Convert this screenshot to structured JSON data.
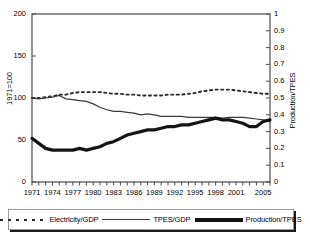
{
  "chart_data": {
    "type": "line",
    "title": "",
    "xlabel": "",
    "ylabel": "1971=100",
    "ylabel_right": "Production/TPES",
    "xlim": [
      1971,
      2006
    ],
    "ylim": [
      0,
      200
    ],
    "ylim_right": [
      0,
      1
    ],
    "grid": false,
    "legend_position": "bottom",
    "x": [
      1971,
      1972,
      1973,
      1974,
      1975,
      1976,
      1977,
      1978,
      1979,
      1980,
      1981,
      1982,
      1983,
      1984,
      1985,
      1986,
      1987,
      1988,
      1989,
      1990,
      1991,
      1992,
      1993,
      1994,
      1995,
      1996,
      1997,
      1998,
      1999,
      2000,
      2001,
      2002,
      2003,
      2004,
      2005,
      2006
    ],
    "yticks_left": [
      "0",
      "50",
      "100",
      "150",
      "200"
    ],
    "yticks_right": [
      "0",
      "0.1",
      "0.2",
      "0.3",
      "0.4",
      "0.5",
      "0.6",
      "0.7",
      "0.8",
      "0.9",
      "1"
    ],
    "xticks": [
      "1971",
      "1974",
      "1977",
      "1980",
      "1983",
      "1986",
      "1989",
      "1992",
      "1995",
      "1998",
      "2001",
      "2005"
    ],
    "series": [
      {
        "name": "Electricity/GDP",
        "axis": "left",
        "style": "dotted",
        "color": "#2b2b2b",
        "values": [
          100,
          100,
          101,
          102,
          104,
          104,
          106,
          107,
          107,
          107,
          107,
          106,
          105,
          105,
          104,
          104,
          103,
          103,
          103,
          103,
          104,
          104,
          104,
          105,
          106,
          108,
          109,
          110,
          110,
          110,
          109,
          108,
          107,
          106,
          105,
          105
        ]
      },
      {
        "name": "TPES/GDP",
        "axis": "left",
        "style": "solid-thin",
        "color": "#3a3a3a",
        "values": [
          100,
          99,
          100,
          101,
          103,
          99,
          98,
          97,
          96,
          93,
          89,
          86,
          84,
          84,
          83,
          82,
          80,
          81,
          80,
          78,
          78,
          78,
          78,
          77,
          77,
          77,
          77,
          77,
          76,
          77,
          77,
          77,
          76,
          75,
          74,
          72
        ]
      },
      {
        "name": "Production/TPES",
        "axis": "right",
        "style": "solid-thick",
        "color": "#141414",
        "values": [
          0.26,
          0.23,
          0.2,
          0.19,
          0.19,
          0.19,
          0.19,
          0.2,
          0.19,
          0.2,
          0.21,
          0.23,
          0.24,
          0.26,
          0.28,
          0.29,
          0.3,
          0.31,
          0.31,
          0.32,
          0.33,
          0.33,
          0.34,
          0.34,
          0.35,
          0.36,
          0.37,
          0.38,
          0.37,
          0.37,
          0.36,
          0.35,
          0.33,
          0.33,
          0.36,
          0.37
        ]
      }
    ]
  },
  "legend": {
    "items": [
      {
        "label": "Electricity/GDP",
        "swatch": "dotted"
      },
      {
        "label": "TPES/GDP",
        "swatch": "solid-thin"
      },
      {
        "label": "Production/TPES",
        "swatch": "solid-thick"
      }
    ]
  }
}
